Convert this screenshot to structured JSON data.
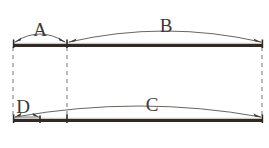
{
  "figure": {
    "type": "dimension-diagram",
    "background_color": "#ffffff",
    "bar_color": "#2f2a26",
    "arc_color": "#6b6560",
    "dashed_color": "#8b8b8b",
    "label_color": "#3a3a3c"
  },
  "labels": {
    "a": "A",
    "b": "B",
    "c": "C",
    "d": "D"
  },
  "geometry": {
    "left_x": 13,
    "mid_x": 67,
    "right_x": 263,
    "top_bar_y": 45,
    "bottom_bar_y": 120
  },
  "segments": [
    {
      "id": "a",
      "label": "A",
      "row": "top",
      "from_x": 13,
      "to_x": 67,
      "baseline_y": 45,
      "label_x": 40,
      "label_y": 34
    },
    {
      "id": "b",
      "label": "B",
      "row": "top",
      "from_x": 67,
      "to_x": 263,
      "baseline_y": 45,
      "label_x": 165,
      "label_y": 30
    },
    {
      "id": "d",
      "label": "D",
      "row": "bottom",
      "from_x": 13,
      "to_x": 40,
      "baseline_y": 120,
      "label_x": 23,
      "label_y": 110
    },
    {
      "id": "c",
      "label": "C",
      "row": "bottom",
      "from_x": 13,
      "to_x": 263,
      "baseline_y": 120,
      "label_x": 152,
      "label_y": 108
    }
  ],
  "extension_lines": [
    {
      "id": "left",
      "x": 13,
      "from_y": 47,
      "to_y": 118
    },
    {
      "id": "middle",
      "x": 67,
      "from_y": 47,
      "to_y": 118
    },
    {
      "id": "right",
      "x": 262,
      "from_y": 47,
      "to_y": 118
    }
  ]
}
